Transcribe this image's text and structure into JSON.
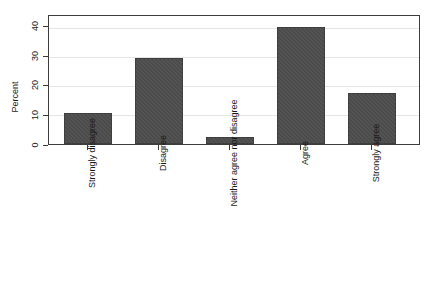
{
  "chart_data": {
    "type": "bar",
    "title": "",
    "xlabel": "",
    "ylabel": "Percent",
    "categories": [
      "Strongly disagree",
      "Disagree",
      "Neither agree nor disagree",
      "Agree",
      "Strongly agree"
    ],
    "values": [
      10.5,
      29.7,
      2.3,
      40.2,
      17.5
    ],
    "ylim": [
      0,
      44
    ],
    "yticks": [
      0,
      10,
      20,
      30,
      40
    ],
    "ytick_labels": [
      "0",
      "10",
      "20",
      "30",
      "40"
    ],
    "grid": true,
    "legend": false,
    "bar_color": "#4b4b4b",
    "axis_color": "#3d3d3d",
    "grid_color": "#e6e6e6",
    "background": "#ffffff"
  }
}
